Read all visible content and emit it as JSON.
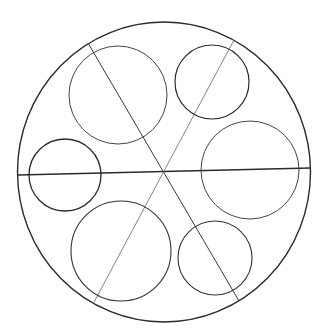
{
  "diagram": {
    "colors": {
      "background": "#ffffff",
      "stroke": "#2a2a2a",
      "thin_stroke": "#555555"
    },
    "outer_circle": {
      "cx": 164,
      "cy": 172,
      "rx": 146.5,
      "ry": 150
    },
    "lines": [
      {
        "id": "horizontal",
        "x1": 18,
        "y1": 175,
        "x2": 310,
        "y2": 168
      },
      {
        "id": "diagonal-tl-br",
        "x1": 88,
        "y1": 43,
        "x2": 239,
        "y2": 301
      },
      {
        "id": "diagonal-tr-bl",
        "x1": 234,
        "y1": 40,
        "x2": 93,
        "y2": 304
      }
    ],
    "inner_circles": [
      {
        "id": "top-left-large",
        "cx": 118,
        "cy": 95,
        "r": 49
      },
      {
        "id": "top-right-small",
        "cx": 212,
        "cy": 82,
        "r": 37
      },
      {
        "id": "left-small",
        "cx": 65,
        "cy": 175,
        "r": 36
      },
      {
        "id": "right-large",
        "cx": 250,
        "cy": 170,
        "r": 49
      },
      {
        "id": "bottom-left-large",
        "cx": 121,
        "cy": 251,
        "r": 50
      },
      {
        "id": "bottom-right-small",
        "cx": 215,
        "cy": 258,
        "r": 37
      }
    ]
  }
}
